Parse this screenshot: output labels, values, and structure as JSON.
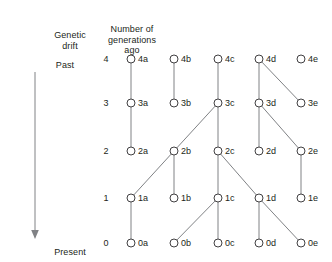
{
  "axis": {
    "title": "Genetic\ndrift",
    "past_label": "Past",
    "present_label": "Present",
    "arrow_icon": "down-arrow-icon"
  },
  "generations_column": {
    "title": "Number of\ngenerations\nago",
    "values": [
      "4",
      "3",
      "2",
      "1",
      "0"
    ]
  },
  "diagram": {
    "columns": [
      "a",
      "b",
      "c",
      "d",
      "e"
    ],
    "column_x": [
      131,
      174,
      218,
      259,
      301
    ],
    "row_y": [
      59,
      103,
      151,
      198,
      243
    ],
    "node_radius": 4,
    "colors": {
      "edge": "#808285",
      "node_stroke": "#414042",
      "node_fill": "#ffffff",
      "text": "#231f20",
      "background": "#ffffff"
    },
    "nodes": [
      {
        "id": "4a",
        "col": 0,
        "row": 0,
        "label": "4a"
      },
      {
        "id": "4b",
        "col": 1,
        "row": 0,
        "label": "4b"
      },
      {
        "id": "4c",
        "col": 2,
        "row": 0,
        "label": "4c"
      },
      {
        "id": "4d",
        "col": 3,
        "row": 0,
        "label": "4d"
      },
      {
        "id": "4e",
        "col": 4,
        "row": 0,
        "label": "4e"
      },
      {
        "id": "3a",
        "col": 0,
        "row": 1,
        "label": "3a"
      },
      {
        "id": "3b",
        "col": 1,
        "row": 1,
        "label": "3b"
      },
      {
        "id": "3c",
        "col": 2,
        "row": 1,
        "label": "3c"
      },
      {
        "id": "3d",
        "col": 3,
        "row": 1,
        "label": "3d"
      },
      {
        "id": "3e",
        "col": 4,
        "row": 1,
        "label": "3e"
      },
      {
        "id": "2a",
        "col": 0,
        "row": 2,
        "label": "2a"
      },
      {
        "id": "2b",
        "col": 1,
        "row": 2,
        "label": "2b"
      },
      {
        "id": "2c",
        "col": 2,
        "row": 2,
        "label": "2c"
      },
      {
        "id": "2d",
        "col": 3,
        "row": 2,
        "label": "2d"
      },
      {
        "id": "2e",
        "col": 4,
        "row": 2,
        "label": "2e"
      },
      {
        "id": "1a",
        "col": 0,
        "row": 3,
        "label": "1a"
      },
      {
        "id": "1b",
        "col": 1,
        "row": 3,
        "label": "1b"
      },
      {
        "id": "1c",
        "col": 2,
        "row": 3,
        "label": "1c"
      },
      {
        "id": "1d",
        "col": 3,
        "row": 3,
        "label": "1d"
      },
      {
        "id": "1e",
        "col": 4,
        "row": 3,
        "label": "1e"
      },
      {
        "id": "0a",
        "col": 0,
        "row": 4,
        "label": "0a"
      },
      {
        "id": "0b",
        "col": 1,
        "row": 4,
        "label": "0b"
      },
      {
        "id": "0c",
        "col": 2,
        "row": 4,
        "label": "0c"
      },
      {
        "id": "0d",
        "col": 3,
        "row": 4,
        "label": "0d"
      },
      {
        "id": "0e",
        "col": 4,
        "row": 4,
        "label": "0e"
      }
    ],
    "edges": [
      {
        "from": "4a",
        "to": "3a"
      },
      {
        "from": "4b",
        "to": "3b"
      },
      {
        "from": "4c",
        "to": "3c"
      },
      {
        "from": "4d",
        "to": "3d"
      },
      {
        "from": "4d",
        "to": "3e"
      },
      {
        "from": "3a",
        "to": "2a"
      },
      {
        "from": "3c",
        "to": "2b"
      },
      {
        "from": "3c",
        "to": "2c"
      },
      {
        "from": "3d",
        "to": "2d"
      },
      {
        "from": "3d",
        "to": "2e"
      },
      {
        "from": "2b",
        "to": "1a"
      },
      {
        "from": "2b",
        "to": "1b"
      },
      {
        "from": "2c",
        "to": "1c"
      },
      {
        "from": "2c",
        "to": "1d"
      },
      {
        "from": "2e",
        "to": "1e"
      },
      {
        "from": "1a",
        "to": "0a"
      },
      {
        "from": "1c",
        "to": "0b"
      },
      {
        "from": "1c",
        "to": "0c"
      },
      {
        "from": "1d",
        "to": "0d"
      },
      {
        "from": "1d",
        "to": "0e"
      }
    ]
  }
}
